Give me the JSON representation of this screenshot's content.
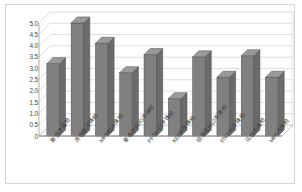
{
  "chart_data": {
    "type": "bar",
    "title": "",
    "subtitle": "",
    "xlabel": "",
    "ylabel": "",
    "ylim": [
      0,
      5.0
    ],
    "grid": true,
    "legend": false,
    "style": "3d-column",
    "bar_color": "#808080",
    "bar_side_color": "#6b6b6b",
    "bar_top_color": "#9a9a9a",
    "bar_edge_color": "#4d4d4d",
    "gridline_color": "#c8c8c8",
    "axis_color": "#9a9a9a",
    "tick_label_color": "#4a4a4a",
    "plot_background": "#ffffff",
    "frame_border_color": "#d4d4d4",
    "ytick_labels": [
      "5.0",
      "4.5",
      "4.0",
      "3.5",
      "3.0",
      "2.5",
      "2.0",
      "1.5",
      "1.0",
      "0.5",
      "0"
    ],
    "ytick_values": [
      5.0,
      4.5,
      4.0,
      3.5,
      3.0,
      2.5,
      2.0,
      1.5,
      1.0,
      0.5,
      0
    ],
    "categories": [
      "斯登冲锋枪",
      "汤普森冲锋枪",
      "MP940冲锋枪",
      "斯泰尔AUG冲锋枪",
      "PPSh-41冲锋枪",
      "KEDR冲锋枪",
      "伯莱塔M12冲锋枪",
      "FN P90冲锋枪",
      "乌兹冲锋枪",
      "MP5冲锋枪"
    ],
    "values": [
      3.2,
      5.0,
      4.1,
      2.8,
      3.6,
      1.65,
      3.5,
      2.6,
      3.55,
      2.6
    ]
  }
}
